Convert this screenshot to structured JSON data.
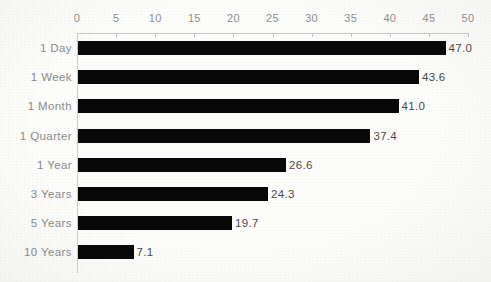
{
  "chart_data": {
    "type": "bar",
    "orientation": "horizontal",
    "title": "",
    "xlabel": "",
    "ylabel": "",
    "xlim": [
      0,
      50
    ],
    "xticks": [
      0,
      5,
      10,
      15,
      20,
      25,
      30,
      35,
      40,
      45,
      50
    ],
    "xtick_labels": [
      "0",
      "5",
      "10",
      "15",
      "20",
      "25",
      "30",
      "35",
      "40",
      "45",
      "50"
    ],
    "grid": false,
    "legend": null,
    "axis_position": "top",
    "bar_color": "#080808",
    "label_color": "#8b8b8b",
    "value_label_color": "#4a4a4a",
    "axis_line_color": "#c9c9c9",
    "categories": [
      "1 Day",
      "1 Week",
      "1 Month",
      "1 Quarter",
      "1 Year",
      "3 Years",
      "5 Years",
      "10 Years"
    ],
    "values": [
      47.0,
      43.6,
      41.0,
      37.4,
      26.6,
      24.3,
      19.7,
      7.1
    ],
    "value_labels": [
      "47.0",
      "43.6",
      "41.0",
      "37.4",
      "26.6",
      "24.3",
      "19.7",
      "7.1"
    ]
  }
}
